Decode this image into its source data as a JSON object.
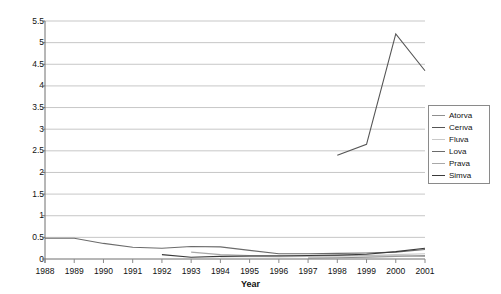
{
  "chart_data": {
    "type": "line",
    "title": "",
    "xlabel": "Year",
    "ylabel": "Reported cases/100,000 prescriptions dispensed",
    "x": [
      1988,
      1989,
      1990,
      1991,
      1992,
      1993,
      1994,
      1995,
      1996,
      1997,
      1998,
      1999,
      2000,
      2001
    ],
    "categories": [
      "1988",
      "1989",
      "1990",
      "1991",
      "1992",
      "1993",
      "1994",
      "1995",
      "1996",
      "1997",
      "1998",
      "1999",
      "2000",
      "2001"
    ],
    "xlim": [
      1988,
      2001
    ],
    "ylim": [
      0,
      5.5
    ],
    "yticks": [
      "0",
      "0.5",
      "1",
      "1.5",
      "2",
      "2.5",
      "3",
      "3.5",
      "4",
      "4.5",
      "5",
      "5.5"
    ],
    "ytick_values": [
      0,
      0.5,
      1,
      1.5,
      2,
      2.5,
      3,
      3.5,
      4,
      4.5,
      5,
      5.5
    ],
    "grid": "horizontal",
    "legend_position": "right",
    "series": [
      {
        "name": "Atorva",
        "color": "#8f8f8f",
        "x": [
          1997,
          1998,
          1999,
          2000,
          2001
        ],
        "values": [
          0.02,
          0.03,
          0.04,
          0.06,
          0.08
        ]
      },
      {
        "name": "Cerıva",
        "color": "#555555",
        "x": [
          1998,
          1999,
          2000,
          2001
        ],
        "values": [
          2.4,
          2.65,
          5.2,
          4.35
        ]
      },
      {
        "name": "Fluva",
        "color": "#c9c9c9",
        "x": [
          1994,
          1995,
          1996,
          1997,
          1998,
          1999,
          2000,
          2001
        ],
        "values": [
          0.05,
          0.06,
          0.05,
          0.06,
          0.07,
          0.08,
          0.1,
          0.12
        ]
      },
      {
        "name": "Lova",
        "color": "#6b6b6b",
        "x": [
          1988,
          1989,
          1990,
          1991,
          1992,
          1993,
          1994,
          1995,
          1996,
          1997,
          1998,
          1999,
          2000,
          2001
        ],
        "values": [
          0.48,
          0.48,
          0.36,
          0.27,
          0.25,
          0.29,
          0.28,
          0.2,
          0.12,
          0.12,
          0.13,
          0.14,
          0.16,
          0.22
        ]
      },
      {
        "name": "Prava",
        "color": "#a8a8a8",
        "x": [
          1993,
          1994,
          1995,
          1996,
          1997,
          1998,
          1999,
          2000,
          2001
        ],
        "values": [
          0.16,
          0.1,
          0.08,
          0.08,
          0.07,
          0.08,
          0.07,
          0.07,
          0.06
        ]
      },
      {
        "name": "Simva",
        "color": "#3a3a3a",
        "x": [
          1992,
          1993,
          1994,
          1995,
          1996,
          1997,
          1998,
          1999,
          2000,
          2001
        ],
        "values": [
          0.1,
          0.04,
          0.06,
          0.07,
          0.07,
          0.08,
          0.09,
          0.11,
          0.17,
          0.25
        ]
      }
    ]
  },
  "legend": {
    "items": [
      {
        "label": "Atorva"
      },
      {
        "label": "Cerıva"
      },
      {
        "label": "Fluva"
      },
      {
        "label": "Lova"
      },
      {
        "label": "Prava"
      },
      {
        "label": "Simva"
      }
    ]
  }
}
